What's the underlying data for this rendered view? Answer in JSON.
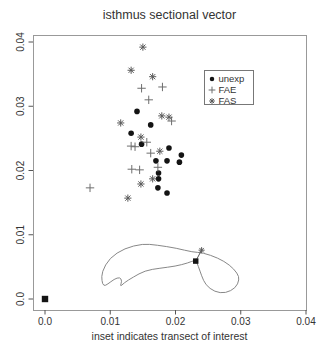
{
  "chart_data": {
    "type": "scatter",
    "title": "isthmus sectional vector",
    "xlabel": "inset indicates transect of interest",
    "ylabel": "",
    "xlim": [
      0,
      0.04
    ],
    "ylim": [
      0,
      0.04
    ],
    "grid": false,
    "legend_position": "top-right-inside",
    "x_ticks": {
      "values": [
        0,
        0.01,
        0.02,
        0.03,
        0.04
      ],
      "labels": [
        "0.0",
        "0.01",
        "0.02",
        "0.03",
        "0.04"
      ]
    },
    "y_ticks": {
      "values": [
        0,
        0.01,
        0.02,
        0.03,
        0.04
      ],
      "labels": [
        "0.0",
        "0.01",
        "0.02",
        "0.03",
        "0.04"
      ]
    },
    "colors": {
      "circle": "#141414",
      "plus": "#6e6e6e",
      "asterisk": "#5a5a5a",
      "outline": "#888888",
      "box": "#999999",
      "tick_text": "#333333"
    },
    "series": [
      {
        "name": "unexp",
        "marker": "circle",
        "color": "#141414",
        "points": [
          [
            0.0141,
            0.0292
          ],
          [
            0.0162,
            0.0271
          ],
          [
            0.0132,
            0.0258
          ],
          [
            0.0148,
            0.0241
          ],
          [
            0.019,
            0.0235
          ],
          [
            0.0209,
            0.0224
          ],
          [
            0.017,
            0.0215
          ],
          [
            0.0187,
            0.0215
          ],
          [
            0.0206,
            0.0213
          ],
          [
            0.0174,
            0.0196
          ],
          [
            0.0174,
            0.0187
          ],
          [
            0.0173,
            0.0173
          ],
          [
            0.0187,
            0.0165
          ]
        ]
      },
      {
        "name": "FAE",
        "marker": "plus",
        "color": "#6e6e6e",
        "points": [
          [
            0.0148,
            0.0328
          ],
          [
            0.018,
            0.033
          ],
          [
            0.0159,
            0.031
          ],
          [
            0.0194,
            0.0277
          ],
          [
            0.0156,
            0.0244
          ],
          [
            0.0132,
            0.0238
          ],
          [
            0.0138,
            0.0237
          ],
          [
            0.0162,
            0.0227
          ],
          [
            0.0173,
            0.0205
          ],
          [
            0.0133,
            0.0202
          ],
          [
            0.0145,
            0.0201
          ],
          [
            0.0069,
            0.0173
          ]
        ]
      },
      {
        "name": "FAS",
        "marker": "asterisk",
        "color": "#5a5a5a",
        "points": [
          [
            0.015,
            0.0392
          ],
          [
            0.0132,
            0.0356
          ],
          [
            0.0165,
            0.0346
          ],
          [
            0.0116,
            0.0274
          ],
          [
            0.0179,
            0.0285
          ],
          [
            0.019,
            0.0283
          ],
          [
            0.0147,
            0.0252
          ],
          [
            0.0176,
            0.023
          ],
          [
            0.0165,
            0.0187
          ],
          [
            0.0147,
            0.0179
          ],
          [
            0.0127,
            0.0157
          ]
        ]
      }
    ],
    "origin_marker": {
      "marker": "square",
      "x": 0.0,
      "y": 0.0,
      "color": "#141414"
    },
    "inset_outline": {
      "points": [
        [
          0.0087,
          0.0042
        ],
        [
          0.0099,
          0.0064
        ],
        [
          0.0122,
          0.0079
        ],
        [
          0.015,
          0.0086
        ],
        [
          0.0171,
          0.0084
        ],
        [
          0.0202,
          0.0079
        ],
        [
          0.0226,
          0.0073
        ],
        [
          0.0242,
          0.0072
        ],
        [
          0.0265,
          0.0064
        ],
        [
          0.0283,
          0.0053
        ],
        [
          0.0295,
          0.004
        ],
        [
          0.0298,
          0.003
        ],
        [
          0.0292,
          0.0017
        ],
        [
          0.0277,
          0.0009
        ],
        [
          0.026,
          0.0011
        ],
        [
          0.0246,
          0.0022
        ],
        [
          0.024,
          0.0036
        ],
        [
          0.0235,
          0.0051
        ],
        [
          0.0231,
          0.0061
        ],
        [
          0.0219,
          0.0056
        ],
        [
          0.02,
          0.0051
        ],
        [
          0.0176,
          0.0048
        ],
        [
          0.0153,
          0.0044
        ],
        [
          0.0135,
          0.0034
        ],
        [
          0.0121,
          0.0025
        ],
        [
          0.0115,
          0.0019
        ],
        [
          0.0118,
          0.0028
        ],
        [
          0.0115,
          0.0034
        ],
        [
          0.0106,
          0.0031
        ],
        [
          0.0096,
          0.0023
        ],
        [
          0.009,
          0.002
        ],
        [
          0.0087,
          0.0028
        ]
      ]
    },
    "transect": {
      "line": [
        [
          0.024,
          0.0076
        ],
        [
          0.0231,
          0.0059
        ]
      ],
      "markers": [
        {
          "marker": "asterisk",
          "x": 0.024,
          "y": 0.0076,
          "color": "#5a5a5a"
        },
        {
          "marker": "square",
          "x": 0.0231,
          "y": 0.0059,
          "color": "#141414"
        }
      ]
    }
  }
}
